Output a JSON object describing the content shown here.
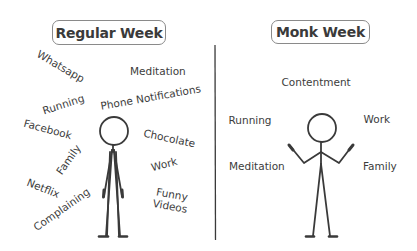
{
  "left_panel": {
    "title": "Regular Week",
    "items": [
      {
        "label": "Whatsapp",
        "x": 60,
        "y": 67,
        "rotate": 30
      },
      {
        "label": "Meditation",
        "x": 158,
        "y": 72,
        "rotate": 0
      },
      {
        "label": "Running",
        "x": 63,
        "y": 105,
        "rotate": -18
      },
      {
        "label": "Phone Notifications",
        "x": 151,
        "y": 98,
        "rotate": -10
      },
      {
        "label": "Facebook",
        "x": 47,
        "y": 130,
        "rotate": 15
      },
      {
        "label": "Chocolate",
        "x": 169,
        "y": 139,
        "rotate": 12
      },
      {
        "label": "Family",
        "x": 69,
        "y": 160,
        "rotate": -55
      },
      {
        "label": "Work",
        "x": 164,
        "y": 165,
        "rotate": -15
      },
      {
        "label": "Netflix",
        "x": 43,
        "y": 189,
        "rotate": 22
      },
      {
        "label": "Funny Videos",
        "x": 171,
        "y": 200,
        "rotate": 10,
        "multiline": true
      },
      {
        "label": "Complaining",
        "x": 62,
        "y": 210,
        "rotate": -35
      }
    ]
  },
  "right_panel": {
    "title": "Monk Week",
    "items": [
      {
        "label": "Contentment",
        "x": 316,
        "y": 83,
        "rotate": 0
      },
      {
        "label": "Running",
        "x": 250,
        "y": 121,
        "rotate": 0
      },
      {
        "label": "Work",
        "x": 377,
        "y": 120,
        "rotate": 0
      },
      {
        "label": "Meditation",
        "x": 257,
        "y": 167,
        "rotate": 0
      },
      {
        "label": "Family",
        "x": 380,
        "y": 167,
        "rotate": 0
      }
    ]
  },
  "colors": {
    "text": "#3c3c3c",
    "line": "#3a3a3a",
    "box_border": "#8a8a8a",
    "background": "#ffffff"
  }
}
